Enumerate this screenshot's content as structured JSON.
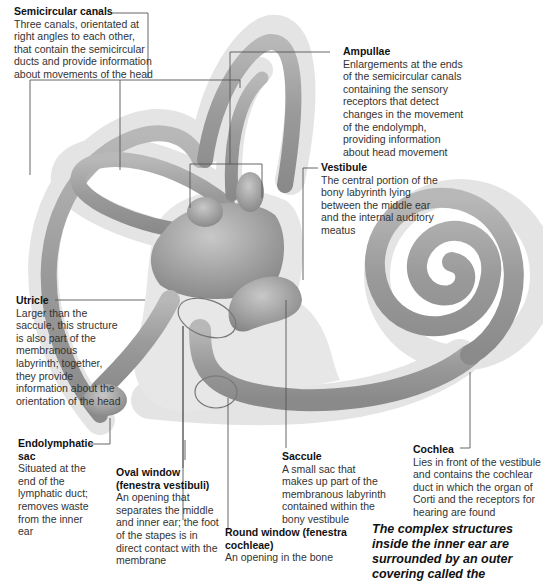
{
  "diagram": {
    "colors": {
      "background": "#ffffff",
      "bony_labyrinth": "#e6e6e6",
      "membranous_duct": "#9a9a9a",
      "duct_highlight": "#bdbdbd",
      "leader_line": "#555555"
    },
    "labels": [
      {
        "id": "semicircular-canals",
        "title": "Semicircular canals",
        "description": "Three canals, orientated at right angles to each other, that contain the semicircular ducts and provide information about movements of the head"
      },
      {
        "id": "ampullae",
        "title": "Ampullae",
        "description": "Enlargements at the ends of the semicircular canals containing the sensory receptors that detect changes in the movement of the endolymph, providing information about head movement"
      },
      {
        "id": "vestibule",
        "title": "Vestibule",
        "description": "The central portion of the bony labyrinth lying between the middle ear and the internal auditory meatus"
      },
      {
        "id": "utricle",
        "title": "Utricle",
        "description": "Larger than the saccule, this structure is also part of the membranous labyrinth; together, they provide information about the orientation of the head"
      },
      {
        "id": "endolymphatic-sac",
        "title": "Endolymphatic sac",
        "description": "Situated at the end of the lymphatic duct; removes waste from the inner ear"
      },
      {
        "id": "oval-window",
        "title": "Oval window (fenestra vestibuli)",
        "description": "An opening that separates the middle and inner ear; the foot of the stapes is in direct contact with the membrane"
      },
      {
        "id": "saccule",
        "title": "Saccule",
        "description": "A small sac that makes up part of the membranous labyrinth contained within the bony vestibule"
      },
      {
        "id": "round-window",
        "title": "Round window (fenestra cochleae)",
        "description": "An opening in the bone"
      },
      {
        "id": "cochlea",
        "title": "Cochlea",
        "description": "Lies in front of the vestibule and contains the cochlear duct in which the organ of Corti and the receptors for hearing are found"
      }
    ],
    "caption": "The complex structures inside the inner ear are surrounded by an outer covering called the"
  }
}
